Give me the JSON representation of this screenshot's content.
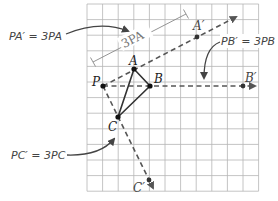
{
  "grid": {
    "left": 87,
    "top": 4,
    "cell": 15.6,
    "cols": 11,
    "rows": 12,
    "line_color": "#b5b5b5"
  },
  "colors": {
    "triangle": "#333333",
    "dashed_ray": "#555555",
    "point": "#111111",
    "annotation_text": "#444444",
    "measure_bar": "#888888"
  },
  "points": {
    "P": {
      "label": "P",
      "x": 103,
      "y": 86
    },
    "A": {
      "label": "A",
      "x": 134,
      "y": 69
    },
    "B": {
      "label": "B",
      "x": 150,
      "y": 86
    },
    "C": {
      "label": "C",
      "x": 118,
      "y": 117
    },
    "A_prime": {
      "label": "A′",
      "x": 197,
      "y": 37
    },
    "B_prime": {
      "label": "B′",
      "x": 243,
      "y": 86
    },
    "C_prime": {
      "label": "C′",
      "x": 149,
      "y": 180
    }
  },
  "annotations": {
    "pa": {
      "text": "PA′ = 3PA"
    },
    "pb": {
      "text": "PB′ = 3PB"
    },
    "pc": {
      "text": "PC′ = 3PC"
    },
    "measure": {
      "text": "3PA"
    }
  }
}
